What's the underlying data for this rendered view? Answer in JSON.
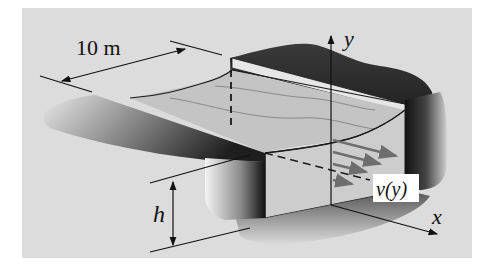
{
  "figure": {
    "labels": {
      "width": "10 m",
      "depth": "h",
      "velocity": "v(y)",
      "x_axis": "x",
      "y_axis": "y"
    },
    "colors": {
      "panel_background": "#dcdcdc",
      "water_surface": "#c8c8c8",
      "water_front": "#cfcfcf",
      "bank_dark": "#2a2a2a",
      "line": "#1a1a1a",
      "arrow": "#6e6e6e"
    }
  }
}
